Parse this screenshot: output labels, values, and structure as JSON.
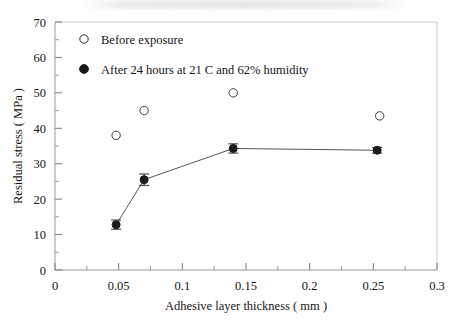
{
  "chart_data": {
    "type": "scatter",
    "title": "",
    "xlabel": "Adhesive layer thickness ( mm )",
    "ylabel": "Residual stress ( MPa )",
    "xlim": [
      0,
      0.3
    ],
    "ylim": [
      0,
      70
    ],
    "xticks": [
      0,
      0.05,
      0.1,
      0.15,
      0.2,
      0.25,
      0.3
    ],
    "xtick_labels": [
      "0",
      "0.05",
      "0.1",
      "0.15",
      "0.2",
      "0.25",
      "0.3"
    ],
    "yticks": [
      0,
      10,
      20,
      30,
      40,
      50,
      60,
      70
    ],
    "ytick_labels": [
      "0",
      "10",
      "20",
      "30",
      "40",
      "50",
      "60",
      "70"
    ],
    "x_minor_step": 0.025,
    "y_minor_step": 5,
    "grid": false,
    "legend_position": "top-left-inside",
    "series": [
      {
        "name": "Before exposure",
        "marker": "open-circle",
        "connected": false,
        "color": "#1a1a1a",
        "points": [
          {
            "x": 0.048,
            "y": 38.0
          },
          {
            "x": 0.07,
            "y": 45.0
          },
          {
            "x": 0.14,
            "y": 50.0
          },
          {
            "x": 0.255,
            "y": 43.5
          }
        ]
      },
      {
        "name": "After 24 hours at 21 C and 62% humidity",
        "marker": "filled-circle",
        "connected": true,
        "color": "#1a1a1a",
        "points": [
          {
            "x": 0.048,
            "y": 12.8,
            "yerr": 1.3
          },
          {
            "x": 0.07,
            "y": 25.5,
            "yerr": 1.6
          },
          {
            "x": 0.14,
            "y": 34.3,
            "yerr": 1.3
          },
          {
            "x": 0.253,
            "y": 33.8,
            "yerr": 0.8
          }
        ]
      }
    ]
  },
  "legend": {
    "items": [
      {
        "label": "Before exposure",
        "marker": "open-circle"
      },
      {
        "label": "After 24 hours at 21 C and 62% humidity",
        "marker": "filled-circle"
      }
    ]
  }
}
